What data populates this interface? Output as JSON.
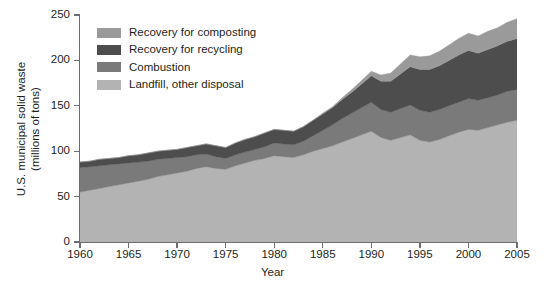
{
  "chart_data": {
    "type": "area",
    "stacked": true,
    "title": "",
    "subtitle": "",
    "xlabel": "Year",
    "ylabel": "U.S. municipal solid waste (millions of tons)",
    "ylabel_line1": "U.S. municipal solid waste",
    "ylabel_line2": "(millions of tons)",
    "xlim": [
      1960,
      2005
    ],
    "ylim": [
      0,
      250
    ],
    "xticks": [
      1960,
      1965,
      1970,
      1975,
      1980,
      1985,
      1990,
      1995,
      2000,
      2005
    ],
    "yticks": [
      0,
      50,
      100,
      150,
      200,
      250
    ],
    "grid": "faint horizontal gridlines",
    "legend_position": "top-left inside plot",
    "x": [
      1960,
      1961,
      1962,
      1963,
      1964,
      1965,
      1966,
      1967,
      1968,
      1969,
      1970,
      1971,
      1972,
      1973,
      1974,
      1975,
      1976,
      1977,
      1978,
      1979,
      1980,
      1981,
      1982,
      1983,
      1984,
      1985,
      1986,
      1987,
      1988,
      1989,
      1990,
      1991,
      1992,
      1993,
      1994,
      1995,
      1996,
      1997,
      1998,
      1999,
      2000,
      2001,
      2002,
      2003,
      2004,
      2005
    ],
    "series": [
      {
        "name": "Landfill, other disposal",
        "color": "#b3b3b3",
        "stack_order": 1,
        "values": [
          55,
          57,
          59,
          61,
          63,
          65,
          67,
          69,
          72,
          74,
          76,
          78,
          81,
          83,
          81,
          80,
          84,
          87,
          90,
          92,
          95,
          94,
          93,
          96,
          100,
          103,
          106,
          110,
          114,
          118,
          122,
          115,
          112,
          115,
          118,
          112,
          110,
          113,
          117,
          121,
          124,
          123,
          126,
          129,
          132,
          134
        ]
      },
      {
        "name": "Combustion",
        "color": "#7a7a7a",
        "stack_order": 2,
        "values": [
          27,
          26,
          25,
          24,
          23,
          22,
          21,
          20,
          19,
          18,
          17,
          16,
          15,
          14,
          13,
          12,
          12,
          12,
          12,
          13,
          14,
          14,
          14,
          15,
          17,
          20,
          23,
          26,
          28,
          30,
          32,
          31,
          31,
          32,
          33,
          33,
          33,
          33,
          33,
          33,
          34,
          33,
          33,
          33,
          34,
          34
        ]
      },
      {
        "name": "Recovery for recycling",
        "color": "#4d4d4d",
        "stack_order": 3,
        "values": [
          6,
          6,
          7,
          7,
          7,
          8,
          8,
          9,
          9,
          9,
          9,
          10,
          10,
          11,
          12,
          12,
          13,
          14,
          14,
          15,
          15,
          15,
          15,
          16,
          17,
          18,
          19,
          21,
          23,
          26,
          29,
          31,
          34,
          38,
          42,
          45,
          47,
          48,
          50,
          52,
          53,
          52,
          53,
          54,
          55,
          56
        ]
      },
      {
        "name": "Recovery for composting",
        "color": "#9a9a9a",
        "stack_order": 4,
        "values": [
          0,
          0,
          0,
          0,
          0,
          0,
          0,
          0,
          0,
          0,
          0,
          0,
          0,
          0,
          0,
          0,
          0,
          0,
          0,
          0,
          0,
          0,
          0,
          0,
          0,
          1,
          1,
          2,
          3,
          4,
          5,
          7,
          9,
          11,
          13,
          14,
          15,
          16,
          17,
          18,
          19,
          19,
          20,
          20,
          21,
          22
        ]
      }
    ],
    "totals": [
      88,
      89,
      91,
      92,
      93,
      95,
      96,
      98,
      100,
      101,
      102,
      104,
      106,
      108,
      106,
      104,
      109,
      113,
      116,
      120,
      124,
      123,
      122,
      127,
      134,
      142,
      149,
      159,
      168,
      178,
      188,
      184,
      186,
      196,
      206,
      204,
      205,
      210,
      217,
      224,
      230,
      227,
      232,
      236,
      242,
      246
    ]
  },
  "legend": {
    "items": [
      {
        "label": "Recovery for composting",
        "color": "#9a9a9a"
      },
      {
        "label": "Recovery for recycling",
        "color": "#4d4d4d"
      },
      {
        "label": "Combustion",
        "color": "#7a7a7a"
      },
      {
        "label": "Landfill, other disposal",
        "color": "#b3b3b3"
      }
    ]
  },
  "axes": {
    "y_title_line1": "U.S. municipal solid waste",
    "y_title_line2": "(millions of tons)",
    "x_title": "Year",
    "y_tick_labels": [
      "0",
      "50",
      "100",
      "150",
      "200",
      "250"
    ],
    "x_tick_labels": [
      "1960",
      "1965",
      "1970",
      "1975",
      "1980",
      "1985",
      "1990",
      "1995",
      "2000",
      "2005"
    ]
  }
}
